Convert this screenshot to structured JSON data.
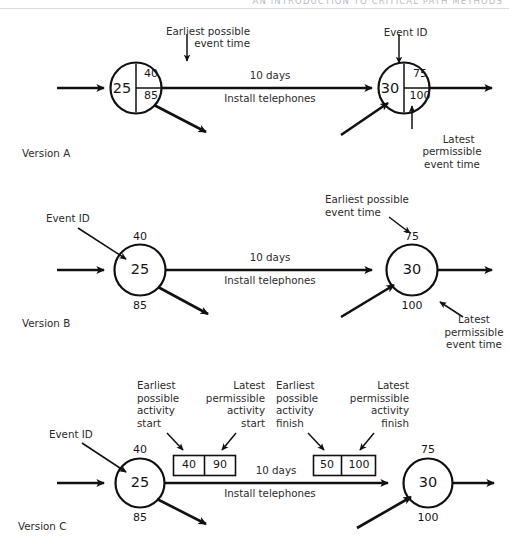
{
  "page": {
    "width": 509,
    "height": 539,
    "background": "#ffffff",
    "ink": "#171717",
    "running_head": "AN INTRODUCTION TO CRITICAL PATH METHODS"
  },
  "common": {
    "activity_duration": "10 days",
    "activity_name": "Install telephones",
    "event_id_label": "Event ID",
    "earliest_event_time_label": "Earliest possible\nevent time",
    "latest_event_time_label": "Latest\npermissible\nevent time"
  },
  "versions": [
    {
      "id": "version-a",
      "caption": "Version A",
      "style": "circle-divided",
      "nodes": [
        {
          "id": "node-a-left",
          "event_id": "25",
          "earliest_time": "40",
          "latest_time": "85"
        },
        {
          "id": "node-a-right",
          "event_id": "30",
          "earliest_time": "75",
          "latest_time": "100"
        }
      ],
      "activity": {
        "duration": "10 days",
        "name": "Install telephones"
      },
      "annotations": [
        {
          "id": "anno-a-earliest",
          "text": "Earliest possible\nevent time",
          "align": "right",
          "arrow": "down"
        },
        {
          "id": "anno-a-event-id",
          "text": "Event ID",
          "align": "center",
          "arrow": "down"
        },
        {
          "id": "anno-a-latest",
          "text": "Latest\npermissible\nevent time",
          "align": "center",
          "arrow": "up"
        }
      ]
    },
    {
      "id": "version-b",
      "caption": "Version B",
      "style": "circle-plain",
      "nodes": [
        {
          "id": "node-b-left",
          "event_id": "25",
          "earliest_time": "40",
          "latest_time": "85"
        },
        {
          "id": "node-b-right",
          "event_id": "30",
          "earliest_time": "75",
          "latest_time": "100"
        }
      ],
      "activity": {
        "duration": "10 days",
        "name": "Install telephones"
      },
      "annotations": [
        {
          "id": "anno-b-event-id",
          "text": "Event ID",
          "align": "left",
          "arrow": "diagonal-down-right"
        },
        {
          "id": "anno-b-earliest",
          "text": "Earliest possible\nevent time",
          "align": "left",
          "arrow": "diagonal-down-right"
        },
        {
          "id": "anno-b-latest",
          "text": "Latest\npermissible\nevent time",
          "align": "center",
          "arrow": "diagonal-up-left"
        }
      ]
    },
    {
      "id": "version-c",
      "caption": "Version C",
      "style": "circle-plain-with-boxes",
      "nodes": [
        {
          "id": "node-c-left",
          "event_id": "25",
          "earliest_time": "40",
          "latest_time": "85"
        },
        {
          "id": "node-c-right",
          "event_id": "30",
          "earliest_time": "75",
          "latest_time": "100"
        }
      ],
      "activity": {
        "duration": "10 days",
        "name": "Install telephones"
      },
      "boxes": [
        {
          "id": "box-c-start",
          "cells": [
            {
              "id": "cell-earliest-start",
              "value": "40"
            },
            {
              "id": "cell-latest-start",
              "value": "90"
            }
          ]
        },
        {
          "id": "box-c-finish",
          "cells": [
            {
              "id": "cell-earliest-finish",
              "value": "50"
            },
            {
              "id": "cell-latest-finish",
              "value": "100"
            }
          ]
        }
      ],
      "annotations": [
        {
          "id": "anno-c-event-id",
          "text": "Event ID",
          "align": "left",
          "arrow": "diagonal-down-right"
        },
        {
          "id": "anno-c-earliest-start",
          "text": "Earliest\npossible\nactivity\nstart",
          "align": "left",
          "arrow": "diagonal-down-right"
        },
        {
          "id": "anno-c-latest-start",
          "text": "Latest\npermissible\nactivity\nstart",
          "align": "right",
          "arrow": "diagonal-down-left"
        },
        {
          "id": "anno-c-earliest-finish",
          "text": "Earliest\npossible\nactivity\nfinish",
          "align": "left",
          "arrow": "diagonal-down-right"
        },
        {
          "id": "anno-c-latest-finish",
          "text": "Latest\npermissible\nactivity\nfinish",
          "align": "right",
          "arrow": "diagonal-down-left"
        }
      ]
    }
  ]
}
